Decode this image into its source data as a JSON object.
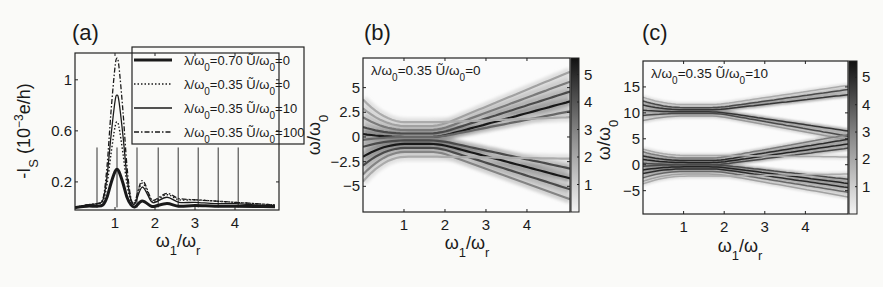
{
  "figure": {
    "panels": [
      "(a)",
      "(b)",
      "(c)"
    ]
  },
  "chart_data": [
    {
      "id": "a",
      "type": "line",
      "panel_label": "(a)",
      "title": "",
      "xlabel": "ω1/ωr",
      "ylabel": "-Is (10^-3 e/h)",
      "xlim": [
        0,
        5.1
      ],
      "ylim": [
        -0.02,
        1.21
      ],
      "xticks": [
        1,
        2,
        3,
        4
      ],
      "yticks": [
        0.2,
        0.6,
        1
      ],
      "ytick_labels": [
        "0.2",
        "0.6",
        "1"
      ],
      "grid": false,
      "legend_position": "upper right (inside, overlapping axes)",
      "vertical_lines": {
        "x": [
          0.55,
          1.05,
          1.55,
          2.08,
          2.58,
          3.08,
          3.58,
          4.08
        ],
        "height": 0.47
      },
      "series": [
        {
          "name": "λ/ω0=0.70  Ũ/ω0=0",
          "style": "thick-solid",
          "peaks": [
            [
              1.05,
              0.3
            ],
            [
              1.68,
              0.05
            ],
            [
              2.3,
              0.03
            ]
          ],
          "x": [
            0.0,
            0.3,
            0.55,
            0.7,
            0.8,
            0.9,
            1.0,
            1.05,
            1.1,
            1.2,
            1.3,
            1.4,
            1.5,
            1.68,
            1.9,
            2.0,
            2.3,
            2.6,
            3.0,
            3.5,
            4.0,
            4.5,
            5.0
          ],
          "y": [
            0.0,
            0.01,
            0.01,
            0.02,
            0.08,
            0.19,
            0.28,
            0.3,
            0.28,
            0.19,
            0.08,
            0.02,
            0.005,
            0.05,
            0.01,
            0.01,
            0.03,
            0.01,
            0.015,
            0.01,
            0.01,
            0.008,
            0.005
          ]
        },
        {
          "name": "λ/ω0=0.35  Ũ/ω0=0",
          "style": "dotted",
          "peaks": [
            [
              1.05,
              0.67
            ],
            [
              1.68,
              0.19
            ],
            [
              2.3,
              0.1
            ]
          ],
          "x": [
            0.0,
            0.3,
            0.55,
            0.7,
            0.8,
            0.9,
            1.0,
            1.05,
            1.1,
            1.2,
            1.3,
            1.4,
            1.5,
            1.68,
            1.9,
            2.0,
            2.3,
            2.6,
            3.0,
            3.5,
            4.0,
            4.5,
            5.0
          ],
          "y": [
            0.0,
            0.02,
            0.03,
            0.05,
            0.18,
            0.42,
            0.63,
            0.67,
            0.63,
            0.42,
            0.18,
            0.05,
            0.04,
            0.19,
            0.06,
            0.05,
            0.1,
            0.06,
            0.06,
            0.05,
            0.04,
            0.03,
            0.02
          ]
        },
        {
          "name": "λ/ω0=0.35  Ũ/ω0=10",
          "style": "thin-solid",
          "peaks": [
            [
              1.05,
              0.88
            ],
            [
              1.68,
              0.16
            ],
            [
              2.3,
              0.08
            ]
          ],
          "x": [
            0.0,
            0.3,
            0.55,
            0.7,
            0.8,
            0.9,
            1.0,
            1.05,
            1.1,
            1.2,
            1.3,
            1.4,
            1.5,
            1.68,
            1.9,
            2.0,
            2.3,
            2.6,
            3.0,
            3.5,
            4.0,
            4.5,
            5.0
          ],
          "y": [
            0.0,
            0.02,
            0.03,
            0.06,
            0.24,
            0.56,
            0.83,
            0.88,
            0.83,
            0.56,
            0.24,
            0.06,
            0.03,
            0.16,
            0.05,
            0.04,
            0.08,
            0.04,
            0.04,
            0.03,
            0.03,
            0.02,
            0.015
          ]
        },
        {
          "name": "λ/ω0=0.35  Ũ/ω0=100",
          "style": "dash-dot",
          "peaks": [
            [
              1.05,
              1.17
            ],
            [
              1.68,
              0.21
            ],
            [
              2.3,
              0.11
            ]
          ],
          "x": [
            0.0,
            0.3,
            0.55,
            0.7,
            0.8,
            0.9,
            1.0,
            1.05,
            1.1,
            1.2,
            1.3,
            1.4,
            1.5,
            1.68,
            1.9,
            2.0,
            2.3,
            2.6,
            3.0,
            3.5,
            4.0,
            4.5,
            5.0
          ],
          "y": [
            0.0,
            0.02,
            0.03,
            0.07,
            0.32,
            0.75,
            1.1,
            1.17,
            1.1,
            0.75,
            0.32,
            0.07,
            0.05,
            0.21,
            0.07,
            0.06,
            0.11,
            0.07,
            0.06,
            0.05,
            0.04,
            0.03,
            0.02
          ]
        }
      ]
    },
    {
      "id": "b",
      "type": "heatmap",
      "panel_label": "(b)",
      "title": "",
      "annotation": "λ/ω0=0.35  Ũ/ω0=0",
      "xlabel": "ω1/ωr",
      "ylabel": "ω/ω0",
      "xlim": [
        0,
        5.05
      ],
      "ylim": [
        -7.6,
        8.0
      ],
      "xticks": [
        1,
        2,
        3,
        4
      ],
      "yticks": [
        5,
        2.5,
        0,
        -2.5,
        -5
      ],
      "ytick_labels": [
        "5",
        "2.5",
        "0",
        "−2.5",
        "−5"
      ],
      "colorbar": {
        "ticks": [
          1,
          2,
          3,
          4,
          5
        ],
        "range": [
          0,
          5.6
        ],
        "colormap": "gray-reversed"
      },
      "description": "Spectral lines fan out from crossings near ω1/ωr≈1 and ≈1.5; upward branches reach ≈+6 and downward ≈−6.5 at ω1/ωr=5",
      "branches": [
        {
          "start": 2.9,
          "cross": 1.1,
          "end": 6.6,
          "intensity": 0.25
        },
        {
          "start": 2.0,
          "cross": 0.7,
          "end": 5.6,
          "intensity": 0.45
        },
        {
          "start": 1.0,
          "cross": 0.35,
          "end": 4.6,
          "intensity": 0.7
        },
        {
          "start": 0.3,
          "cross": 0.0,
          "end": 3.6,
          "intensity": 0.95
        },
        {
          "start": -0.3,
          "cross": 0.0,
          "end": 2.6,
          "intensity": 0.55
        },
        {
          "start": -1.0,
          "cross": -0.35,
          "end": -3.2,
          "intensity": 0.7
        },
        {
          "start": -2.0,
          "cross": -0.7,
          "end": -4.2,
          "intensity": 0.95
        },
        {
          "start": -2.9,
          "cross": -1.1,
          "end": -5.3,
          "intensity": 0.7
        },
        {
          "start": -3.8,
          "cross": -1.5,
          "end": -6.3,
          "intensity": 0.4
        },
        {
          "start": 3.8,
          "cross": 1.5,
          "end": 2.0,
          "intensity": 0.2
        },
        {
          "start": -4.5,
          "cross": -2.0,
          "end": -2.2,
          "intensity": 0.2
        }
      ]
    },
    {
      "id": "c",
      "type": "heatmap",
      "panel_label": "(c)",
      "title": "",
      "annotation": "λ/ω0=0.35  Ũ/ω0=10",
      "xlabel": "ω1/ωr",
      "ylabel": "ω/ω0",
      "xlim": [
        0,
        5.05
      ],
      "ylim": [
        -9.5,
        20.0
      ],
      "xticks": [
        1,
        2,
        3,
        4
      ],
      "yticks": [
        15,
        10,
        5,
        0,
        -5
      ],
      "ytick_labels": [
        "15",
        "10",
        "5",
        "0",
        "−5"
      ],
      "colorbar": {
        "ticks": [
          1,
          2,
          3,
          4,
          5
        ],
        "range": [
          0,
          5.6
        ],
        "colormap": "gray-reversed"
      },
      "description": "Two groups of lines: an upper group near ω/ω0≈10 and a lower group near ω/ω0≈0, each fanning out as ω1/ωr increases",
      "branches": [
        {
          "start": 12.3,
          "cross": 11.0,
          "end": 14.5,
          "intensity": 0.7
        },
        {
          "start": 11.5,
          "cross": 10.6,
          "end": 13.5,
          "intensity": 0.8
        },
        {
          "start": 10.5,
          "cross": 10.2,
          "end": 6.5,
          "intensity": 0.8
        },
        {
          "start": 9.5,
          "cross": 9.9,
          "end": 5.5,
          "intensity": 0.7
        },
        {
          "start": 8.5,
          "cross": 9.4,
          "end": 4.8,
          "intensity": 0.3
        },
        {
          "start": 13.0,
          "cross": 11.6,
          "end": 15.3,
          "intensity": 0.2
        },
        {
          "start": 2.5,
          "cross": 1.3,
          "end": 5.8,
          "intensity": 0.45
        },
        {
          "start": 1.7,
          "cross": 0.8,
          "end": 4.9,
          "intensity": 0.85
        },
        {
          "start": 1.0,
          "cross": 0.4,
          "end": 4.0,
          "intensity": 0.9
        },
        {
          "start": 0.3,
          "cross": 0.0,
          "end": 3.2,
          "intensity": 0.7
        },
        {
          "start": -0.3,
          "cross": 0.0,
          "end": -2.8,
          "intensity": 0.7
        },
        {
          "start": -1.0,
          "cross": -0.4,
          "end": -3.6,
          "intensity": 0.9
        },
        {
          "start": -1.7,
          "cross": -0.8,
          "end": -4.4,
          "intensity": 0.85
        },
        {
          "start": -2.5,
          "cross": -1.3,
          "end": -5.3,
          "intensity": 0.55
        },
        {
          "start": -3.2,
          "cross": -1.8,
          "end": -6.2,
          "intensity": 0.25
        },
        {
          "start": 3.0,
          "cross": 1.8,
          "end": 1.5,
          "intensity": 0.2
        },
        {
          "start": -3.7,
          "cross": -2.2,
          "end": -1.8,
          "intensity": 0.2
        }
      ]
    }
  ]
}
